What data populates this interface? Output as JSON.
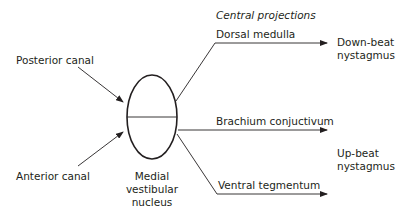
{
  "diagram": {
    "heading": "Central projections",
    "inputs": [
      {
        "label": "Posterior canal"
      },
      {
        "label": "Anterior canal"
      }
    ],
    "nucleus": {
      "line1": "Medial",
      "line2": "vestibular",
      "line3": "nucleus"
    },
    "pathways": [
      {
        "label": "Dorsal medulla"
      },
      {
        "label": "Brachium conjuctivum"
      },
      {
        "label": "Ventral tegmentum"
      }
    ],
    "outcomes": [
      {
        "line1": "Down-beat",
        "line2": "nystagmus"
      },
      {
        "line1": "Up-beat",
        "line2": "nystagmus"
      }
    ],
    "colors": {
      "stroke": "#231f20",
      "text": "#231f20",
      "background": "#ffffff"
    }
  }
}
